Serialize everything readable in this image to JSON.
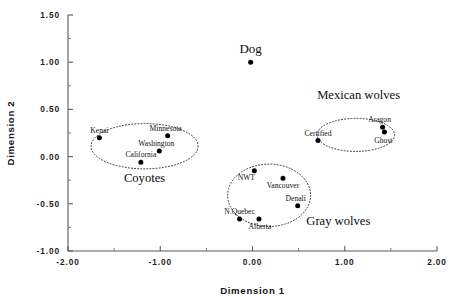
{
  "chart_data": {
    "type": "scatter",
    "title": "",
    "xlabel": "Dimension  1",
    "ylabel": "Dimension  2",
    "xlim": [
      -2.0,
      2.0
    ],
    "ylim": [
      -1.0,
      1.5
    ],
    "xticks": [
      "-2.00",
      "-1.00",
      "0.00",
      "1.00",
      "2.00"
    ],
    "xtick_values": [
      -2.0,
      -1.0,
      0.0,
      1.0,
      2.0
    ],
    "xminor_values": [
      -1.5,
      -0.5,
      0.5,
      1.5
    ],
    "yticks": [
      "1.50",
      "1.00",
      "0.50",
      "0.00",
      "-0.50",
      "-1.00"
    ],
    "ytick_values": [
      1.5,
      1.0,
      0.5,
      0.0,
      -0.5,
      -1.0
    ],
    "yminor_values": [
      1.25,
      0.75,
      0.25,
      -0.25,
      -0.75
    ],
    "grid": false,
    "legend": "none",
    "point_color": "#000000",
    "series": [
      {
        "name": "Dog",
        "points": [
          {
            "label": "Dog",
            "x": -0.02,
            "y": 1.0,
            "label_dx": 0,
            "label_dy": -9,
            "label_anchor": "middle",
            "label_style": "dog"
          }
        ]
      },
      {
        "name": "Coyotes",
        "points": [
          {
            "label": "Kenai",
            "x": -1.66,
            "y": 0.2,
            "label_dx": 0,
            "label_dy": -5,
            "label_anchor": "middle",
            "label_style": "point"
          },
          {
            "label": "Minnesota",
            "x": -0.92,
            "y": 0.22,
            "label_dx": -2,
            "label_dy": -5,
            "label_anchor": "middle",
            "label_style": "point"
          },
          {
            "label": "Washington",
            "x": -1.01,
            "y": 0.06,
            "label_dx": -3,
            "label_dy": -5,
            "label_anchor": "middle",
            "label_style": "point"
          },
          {
            "label": "California",
            "x": -1.21,
            "y": -0.06,
            "label_dx": 0,
            "label_dy": -5,
            "label_anchor": "middle",
            "label_style": "point"
          }
        ]
      },
      {
        "name": "Gray wolves",
        "points": [
          {
            "label": "NWT",
            "x": 0.02,
            "y": -0.15,
            "label_dx": -8,
            "label_dy": 9,
            "label_anchor": "middle",
            "label_style": "point"
          },
          {
            "label": "Vancouver",
            "x": 0.33,
            "y": -0.23,
            "label_dx": 0,
            "label_dy": 10,
            "label_anchor": "middle",
            "label_style": "point"
          },
          {
            "label": "Denali",
            "x": 0.49,
            "y": -0.52,
            "label_dx": -2,
            "label_dy": -5,
            "label_anchor": "middle",
            "label_style": "point"
          },
          {
            "label": "N.Quebec",
            "x": -0.14,
            "y": -0.66,
            "label_dx": 0,
            "label_dy": -5,
            "label_anchor": "middle",
            "label_style": "point"
          },
          {
            "label": "Alberta",
            "x": 0.07,
            "y": -0.66,
            "label_dx": 1,
            "label_dy": 10,
            "label_anchor": "middle",
            "label_style": "point"
          }
        ]
      },
      {
        "name": "Mexican wolves",
        "points": [
          {
            "label": "Certified",
            "x": 0.71,
            "y": 0.17,
            "label_dx": 0,
            "label_dy": -5,
            "label_anchor": "middle",
            "label_style": "point"
          },
          {
            "label": "Aragon",
            "x": 1.41,
            "y": 0.31,
            "label_dx": -3,
            "label_dy": -5,
            "label_anchor": "middle",
            "label_style": "point"
          },
          {
            "label": "Ghost",
            "x": 1.43,
            "y": 0.26,
            "label_dx": -1,
            "label_dy": 11,
            "label_anchor": "middle",
            "label_style": "point"
          }
        ]
      }
    ],
    "clusters": [
      {
        "name": "Coyotes",
        "label": "Coyotes",
        "cx": -1.17,
        "cy": 0.11,
        "rx": 0.58,
        "ry": 0.24,
        "label_x": -1.17,
        "label_y": -0.27
      },
      {
        "name": "Gray wolves",
        "label": "Gray wolves",
        "cx": 0.18,
        "cy": -0.41,
        "rx": 0.45,
        "ry": 0.33,
        "label_x": 0.93,
        "label_y": -0.72
      },
      {
        "name": "Mexican wolves",
        "label": "Mexican wolves",
        "cx": 1.12,
        "cy": 0.23,
        "rx": 0.42,
        "ry": 0.175,
        "label_x": 1.15,
        "label_y": 0.61
      }
    ]
  }
}
